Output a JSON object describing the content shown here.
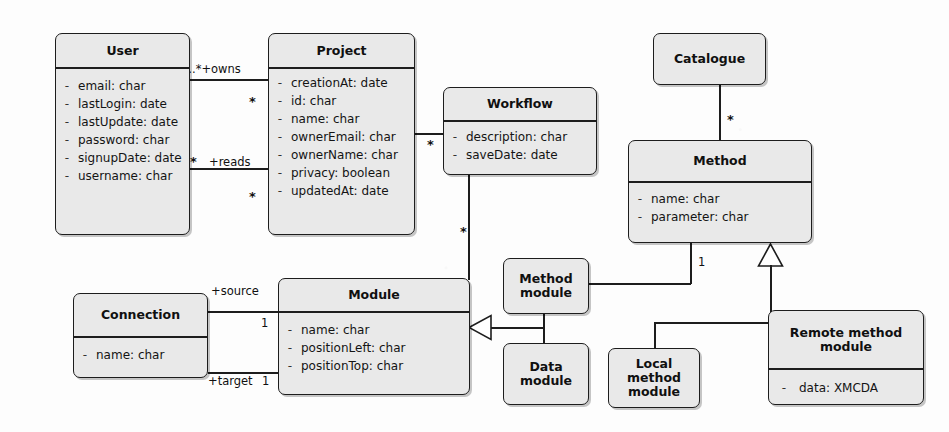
{
  "diagram": {
    "style": {
      "box_fill": "#e9e9e9",
      "box_stroke": "#1d1d1d",
      "background": "#fdfdfd",
      "text_color": "#101010"
    },
    "classes": [
      {
        "id": "user",
        "name": "User",
        "attributes": [
          {
            "visibility": "-",
            "signature": "email: char"
          },
          {
            "visibility": "-",
            "signature": "lastLogin: date"
          },
          {
            "visibility": "-",
            "signature": "lastUpdate: date"
          },
          {
            "visibility": "-",
            "signature": "password: char"
          },
          {
            "visibility": "-",
            "signature": "signupDate: date"
          },
          {
            "visibility": "-",
            "signature": "username: char"
          }
        ]
      },
      {
        "id": "project",
        "name": "Project",
        "attributes": [
          {
            "visibility": "-",
            "signature": "creationAt: date"
          },
          {
            "visibility": "-",
            "signature": "id: char"
          },
          {
            "visibility": "-",
            "signature": "name: char"
          },
          {
            "visibility": "-",
            "signature": "ownerEmail: char"
          },
          {
            "visibility": "-",
            "signature": "ownerName: char"
          },
          {
            "visibility": "-",
            "signature": "privacy: boolean"
          },
          {
            "visibility": "-",
            "signature": "updatedAt: date"
          }
        ]
      },
      {
        "id": "workflow",
        "name": "Workflow",
        "attributes": [
          {
            "visibility": "-",
            "signature": "description: char"
          },
          {
            "visibility": "-",
            "signature": "saveDate: date"
          }
        ]
      },
      {
        "id": "catalogue",
        "name": "Catalogue",
        "attributes": []
      },
      {
        "id": "method",
        "name": "Method",
        "attributes": [
          {
            "visibility": "-",
            "signature": "name: char"
          },
          {
            "visibility": "-",
            "signature": "parameter: char"
          }
        ]
      },
      {
        "id": "connection",
        "name": "Connection",
        "attributes": [
          {
            "visibility": "-",
            "signature": "name: char"
          }
        ]
      },
      {
        "id": "module",
        "name": "Module",
        "attributes": [
          {
            "visibility": "-",
            "signature": "name: char"
          },
          {
            "visibility": "-",
            "signature": "positionLeft: char"
          },
          {
            "visibility": "-",
            "signature": "positionTop: char"
          }
        ]
      },
      {
        "id": "method_module",
        "name": "Method module",
        "name_line1": "Method",
        "name_line2": "module",
        "attributes": []
      },
      {
        "id": "data_module",
        "name": "Data module",
        "name_line1": "Data",
        "name_line2": "module",
        "attributes": []
      },
      {
        "id": "local_method_module",
        "name": "Local method module",
        "name_line1": "Local method",
        "name_line2": "module",
        "attributes": []
      },
      {
        "id": "remote_method_module",
        "name": "Remote method module",
        "name_line1": "Remote method",
        "name_line2": "module",
        "attributes": [
          {
            "visibility": "-",
            "signature": "data: XMCDA"
          }
        ]
      }
    ],
    "relationships": [
      {
        "id": "user_owns_project",
        "type": "association",
        "from": "user",
        "to": "project",
        "source_multiplicity": "1..*",
        "role": "+owns",
        "target_multiplicity": "*"
      },
      {
        "id": "user_reads_project",
        "type": "association",
        "from": "user",
        "to": "project",
        "source_multiplicity": "*",
        "role": "+reads",
        "target_multiplicity": "*"
      },
      {
        "id": "project_workflow",
        "type": "association",
        "from": "project",
        "to": "workflow",
        "target_multiplicity": "*"
      },
      {
        "id": "workflow_module",
        "type": "association",
        "from": "workflow",
        "to": "module",
        "source_multiplicity": "*"
      },
      {
        "id": "catalogue_method",
        "type": "association",
        "from": "catalogue",
        "to": "method",
        "target_multiplicity": "*"
      },
      {
        "id": "method_methodmodule",
        "type": "association",
        "from": "method",
        "to": "method_module",
        "source_multiplicity": "1"
      },
      {
        "id": "connection_module_source",
        "type": "association",
        "from": "connection",
        "to": "module",
        "role": "+source",
        "target_multiplicity": "1"
      },
      {
        "id": "connection_module_target",
        "type": "association",
        "from": "connection",
        "to": "module",
        "role": "+target",
        "target_multiplicity": "1"
      },
      {
        "id": "methodmodule_generalizes_module",
        "type": "generalization",
        "from": "method_module",
        "to": "module"
      },
      {
        "id": "datamodule_generalizes_module",
        "type": "generalization",
        "from": "data_module",
        "to": "module"
      },
      {
        "id": "localmethodmodule_generalizes_method",
        "type": "generalization",
        "from": "local_method_module",
        "to": "method"
      },
      {
        "id": "remotemethodmodule_generalizes_method",
        "type": "generalization",
        "from": "remote_method_module",
        "to": "method"
      }
    ],
    "labels": {
      "owns_multiplicity_role": "1..*+owns",
      "reads_role": "+reads",
      "source_role": "+source",
      "target_role": "+target",
      "one": "1",
      "star": "*"
    }
  }
}
